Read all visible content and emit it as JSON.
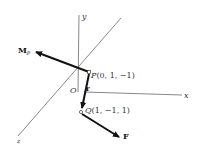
{
  "diagram": {
    "axes": {
      "x_label": "x",
      "y_label": "y",
      "z_label": "z",
      "origin_label": "O"
    },
    "points": {
      "P": {
        "name": "P",
        "coords": "(0, 1, −1)"
      },
      "Q": {
        "name": "Q",
        "coords": "(1, −1, 1)"
      }
    },
    "vectors": {
      "moment": {
        "label": "M",
        "subscript": "P"
      },
      "position": {
        "label": "r"
      },
      "force": {
        "label": "F"
      }
    },
    "colors": {
      "axis": "#555555",
      "vector": "#111111",
      "background": "#ffffff"
    }
  }
}
